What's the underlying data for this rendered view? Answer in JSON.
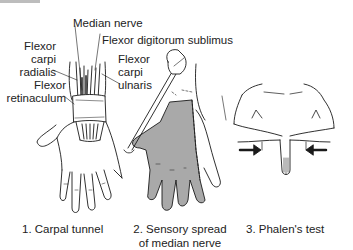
{
  "figure": {
    "labels": {
      "median_nerve": "Median nerve",
      "flexor_digitorum_sublimus": "Flexor digitorum sublimus",
      "flexor_carpi_radialis_1": "Flexor",
      "flexor_carpi_radialis_2": "carpi",
      "flexor_carpi_radialis_3": "radialis",
      "flexor_carpi_ulnaris_1": "Flexor",
      "flexor_carpi_ulnaris_2": "carpi",
      "flexor_carpi_ulnaris_3": "ulnaris",
      "flexor_retinaculum_1": "Flexor",
      "flexor_retinaculum_2": "retinaculum"
    },
    "panels": [
      {
        "caption_1": "1. Carpal tunnel",
        "caption_2": ""
      },
      {
        "caption_1": "2. Sensory spread",
        "caption_2": "of median nerve"
      },
      {
        "caption_1": "3. Phalen's test",
        "caption_2": ""
      }
    ],
    "colors": {
      "line": "#1a1a1a",
      "shading": "#a9a9a9",
      "background": "#ffffff"
    }
  }
}
